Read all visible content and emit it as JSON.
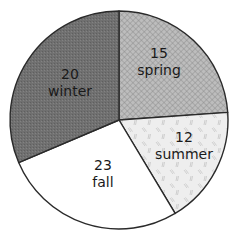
{
  "chart_data": {
    "type": "pie",
    "title": "",
    "center": [
      119,
      120
    ],
    "radius": 109,
    "start_angle_deg": 0,
    "direction": "clockwise",
    "slices": [
      {
        "label": "spring",
        "value": 15,
        "start": 0,
        "end": 86,
        "fill": "#b5b5b5",
        "pattern": "crosshatch",
        "label_pos": [
          159,
          62
        ]
      },
      {
        "label": "summer",
        "value": 12,
        "start": 86,
        "end": 149,
        "fill": "#ececec",
        "pattern": "dashes",
        "label_pos": [
          184,
          146
        ]
      },
      {
        "label": "fall",
        "value": 23,
        "start": 149,
        "end": 247,
        "fill": "#ffffff",
        "pattern": "none",
        "label_pos": [
          103,
          173
        ]
      },
      {
        "label": "winter",
        "value": 20,
        "start": 247,
        "end": 360,
        "fill": "#6f6f6f",
        "pattern": "stipple",
        "label_pos": [
          70,
          82
        ]
      }
    ],
    "categories": [
      "spring",
      "summer",
      "fall",
      "winter"
    ],
    "values": [
      15,
      12,
      23,
      20
    ],
    "legend": "none",
    "xlabel": "",
    "ylabel": ""
  },
  "labels": {
    "spring": {
      "value": "15",
      "name": "spring"
    },
    "summer": {
      "value": "12",
      "name": "summer"
    },
    "fall": {
      "value": "23",
      "name": "fall"
    },
    "winter": {
      "value": "20",
      "name": "winter"
    }
  }
}
